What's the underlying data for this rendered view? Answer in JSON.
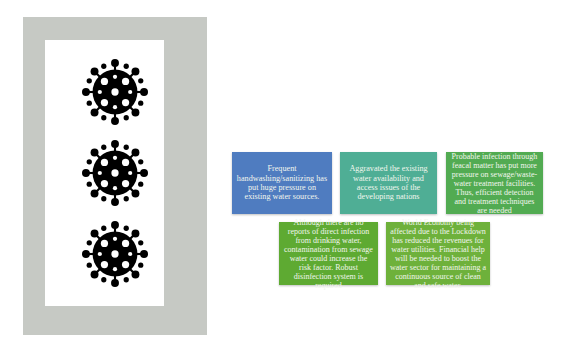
{
  "left_panel": {
    "frame_color": "#c6c9c4",
    "icons": [
      {
        "name": "virus-icon",
        "label": "coronavirus"
      },
      {
        "name": "virus-icon",
        "label": "coronavirus"
      },
      {
        "name": "virus-icon",
        "label": "coronavirus"
      }
    ]
  },
  "boxes": [
    {
      "id": "handwashing",
      "color": "#4f7cc0",
      "text": "Frequent handwashing/sanitizing has put huge pressure on existing water sources."
    },
    {
      "id": "water-availability",
      "color": "#4fae95",
      "text": "Aggravated the existing water availability and access issues of the developing nations"
    },
    {
      "id": "faecal-infection",
      "color": "#52ab52",
      "text": "Probable infection through feacal matter has put more pressure on sewage/waste-water treatment facilities. Thus, efficient detection and treatment techniques are needed"
    },
    {
      "id": "drinking-water",
      "color": "#5eaa32",
      "text": "Although there are no reports of direct infection from drinking water, contamination from sewage water could increase the risk factor. Robust disinfection system is required"
    },
    {
      "id": "economy",
      "color": "#6eb13b",
      "text": "World Economy being affected due to the Lockdown has reduced the revenues for water utilities.  Financial help will be needed to boost the water sector for maintaining a continuous source of clean and safe water."
    }
  ]
}
